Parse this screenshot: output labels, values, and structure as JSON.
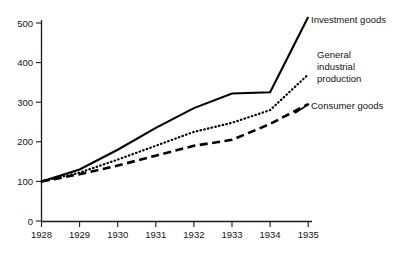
{
  "chart_data": {
    "type": "line",
    "title": "",
    "subtitle": "",
    "xlabel": "",
    "ylabel": "",
    "categories": [
      "1928",
      "1929",
      "1930",
      "1931",
      "1932",
      "1933",
      "1934",
      "1935"
    ],
    "x": [
      1928,
      1929,
      1930,
      1931,
      1932,
      1933,
      1934,
      1935
    ],
    "xlim": [
      1928,
      1935
    ],
    "ylim": [
      0,
      515
    ],
    "y_ticks": [
      0,
      100,
      200,
      300,
      400,
      500
    ],
    "y_tick_labels": [
      "0",
      "100",
      "200",
      "300",
      "400",
      "500"
    ],
    "x_tick_labels": [
      "1928",
      "1929",
      "1930",
      "1931",
      "1932",
      "1933",
      "1934",
      "1935"
    ],
    "grid": false,
    "legend_position": "right-inline-annotations",
    "base_index_note": "1928 = 100",
    "series": [
      {
        "name": "Investment goods",
        "style": "solid",
        "color": "#000000",
        "values": [
          100,
          130,
          180,
          235,
          285,
          322,
          325,
          515
        ]
      },
      {
        "name": "General industrial production",
        "style": "dotted",
        "color": "#000000",
        "label_lines": [
          "General",
          "industrial",
          "production"
        ],
        "values": [
          100,
          122,
          155,
          190,
          225,
          248,
          280,
          370
        ]
      },
      {
        "name": "Consumer goods",
        "style": "dashed",
        "color": "#000000",
        "values": [
          100,
          118,
          140,
          165,
          190,
          205,
          245,
          295
        ]
      }
    ]
  },
  "annotations": {
    "investment": {
      "text": "Investment goods"
    },
    "general": {
      "line1": "General",
      "line2": "industrial",
      "line3": "production"
    },
    "consumer": {
      "text": "Consumer goods"
    }
  },
  "colors": {
    "axis": "#1a1a1a",
    "text": "#141414",
    "series": "#000000",
    "background": "#ffffff"
  }
}
